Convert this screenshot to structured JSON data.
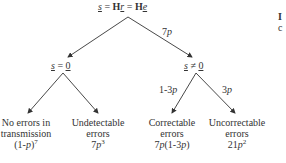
{
  "diagram": {
    "type": "probability-tree",
    "root": {
      "syndrome_var": "s",
      "equals": " = ",
      "H1": "H",
      "r_var": "r",
      "H2": "H",
      "e_var": "e"
    },
    "left_node": {
      "var": "s",
      "rel": " = ",
      "val": "0"
    },
    "right_node": {
      "var": "s",
      "rel": " ≠ ",
      "val": "0"
    },
    "edges": {
      "root_right": {
        "coef": "7",
        "var": "p"
      },
      "right_left": {
        "prefix": "1-3",
        "var": "p"
      },
      "right_right": {
        "coef": "3",
        "var": "p"
      }
    },
    "leaves": [
      {
        "line1": "No errors in",
        "line2": "transmission",
        "prob_a": "(1-",
        "prob_var": "p",
        "prob_b": ")",
        "prob_exp": "7"
      },
      {
        "line1": "Undetectable",
        "line2": "errors",
        "prob_a": "7",
        "prob_var": "p",
        "prob_b": "",
        "prob_exp": "3"
      },
      {
        "line1": "Correctable",
        "line2": "errors",
        "prob_a": "7",
        "prob_var": "p",
        "prob_b": "(1-3",
        "prob_var2": "p",
        "prob_c": ")"
      },
      {
        "line1": "Uncorrectable",
        "line2": "errors",
        "prob_a": "21",
        "prob_var": "p",
        "prob_exp": "2"
      }
    ],
    "side_fragment": {
      "line1": "I",
      "line2": "c"
    },
    "colors": {
      "line": "#333333",
      "text": "#333333",
      "background": "#ffffff"
    }
  }
}
